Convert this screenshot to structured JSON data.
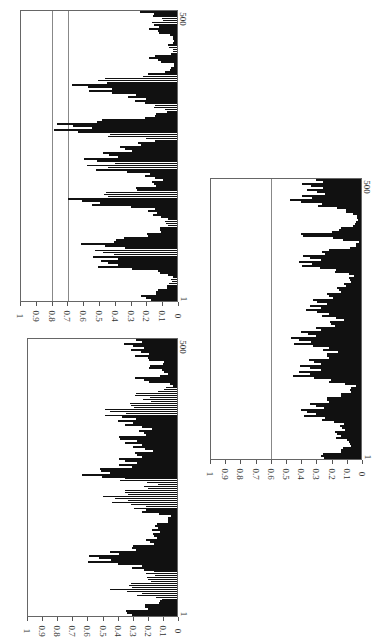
{
  "chart_data": [
    {
      "type": "bar",
      "title": "",
      "orientation": "rotated 90deg clockwise (value axis along bottom, index axis along right)",
      "xlabel": "",
      "ylabel": "",
      "x_ticks": [
        "1",
        "500"
      ],
      "y_ticks": [
        "0",
        "0.1",
        "0.2",
        "0.3",
        "0.4",
        "0.5",
        "0.6",
        "0.7",
        "0.8",
        "0.9",
        "1"
      ],
      "xlim": [
        1,
        500
      ],
      "ylim": [
        0,
        1
      ],
      "reference_lines": [
        0.8,
        0.7
      ],
      "x": [
        1,
        10,
        20,
        30,
        40,
        50,
        60,
        70,
        80,
        90,
        100,
        110,
        120,
        130,
        140,
        150,
        160,
        170,
        180,
        190,
        200,
        210,
        220,
        230,
        240,
        250,
        260,
        270,
        280,
        290,
        300,
        310,
        320,
        330,
        340,
        350,
        360,
        370,
        380,
        390,
        400,
        410,
        420,
        430,
        440,
        450,
        460,
        470,
        480,
        490,
        500
      ],
      "values": [
        0.3,
        0.25,
        0.12,
        0.05,
        0.04,
        0.15,
        0.63,
        0.5,
        0.73,
        0.55,
        0.7,
        0.3,
        0.18,
        0.1,
        0.08,
        0.18,
        0.26,
        0.85,
        0.72,
        0.4,
        0.22,
        0.15,
        0.27,
        0.65,
        0.74,
        0.62,
        0.45,
        0.35,
        0.22,
        0.84,
        0.87,
        0.76,
        0.2,
        0.08,
        0.25,
        0.3,
        0.58,
        0.76,
        0.7,
        0.27,
        0.05,
        0.02,
        0.25,
        0.02,
        0.08,
        0.02,
        0.05,
        0.22,
        0.2,
        0.12,
        0.3
      ]
    },
    {
      "type": "bar",
      "title": "",
      "orientation": "rotated 90deg clockwise (value axis along bottom, index axis along right)",
      "xlabel": "",
      "ylabel": "",
      "x_ticks": [
        "1",
        "500"
      ],
      "y_ticks": [
        "0",
        "0.1",
        "0.2",
        "0.3",
        "0.4",
        "0.5",
        "0.6",
        "0.7",
        "0.8",
        "0.9",
        "1"
      ],
      "xlim": [
        1,
        500
      ],
      "ylim": [
        0,
        1
      ],
      "reference_lines": [],
      "x": [
        1,
        10,
        20,
        30,
        40,
        50,
        60,
        70,
        80,
        90,
        100,
        110,
        120,
        130,
        140,
        150,
        160,
        170,
        180,
        190,
        200,
        210,
        220,
        230,
        240,
        250,
        260,
        270,
        280,
        290,
        300,
        310,
        320,
        330,
        340,
        350,
        360,
        370,
        380,
        390,
        400,
        410,
        420,
        430,
        440,
        450,
        460,
        470,
        480,
        490,
        500
      ],
      "values": [
        0.55,
        0.35,
        0.22,
        0.1,
        0.42,
        0.54,
        0.3,
        0.2,
        0.28,
        0.37,
        0.72,
        0.6,
        0.5,
        0.26,
        0.22,
        0.16,
        0.24,
        0.1,
        0.05,
        0.3,
        0.4,
        0.57,
        0.52,
        0.3,
        0.22,
        0.65,
        0.72,
        0.45,
        0.5,
        0.38,
        0.24,
        0.35,
        0.55,
        0.3,
        0.26,
        0.45,
        0.52,
        0.61,
        0.42,
        0.24,
        0.4,
        0.12,
        0.02,
        0.4,
        0.05,
        0.25,
        0.1,
        0.34,
        0.34,
        0.4,
        0.35
      ]
    },
    {
      "type": "bar",
      "title": "",
      "orientation": "rotated 90deg clockwise (value axis along bottom, index axis along right)",
      "xlabel": "",
      "ylabel": "",
      "x_ticks": [
        "1",
        "500"
      ],
      "y_ticks": [
        "0",
        "0.1",
        "0.2",
        "0.3",
        "0.4",
        "0.5",
        "0.6",
        "0.7",
        "0.8",
        "0.9",
        "1"
      ],
      "xlim": [
        1,
        500
      ],
      "ylim": [
        0,
        1
      ],
      "reference_lines": [
        0.6
      ],
      "x": [
        1,
        10,
        20,
        30,
        40,
        50,
        60,
        70,
        80,
        90,
        100,
        110,
        120,
        130,
        140,
        150,
        160,
        170,
        180,
        190,
        200,
        210,
        220,
        230,
        240,
        250,
        260,
        270,
        280,
        290,
        300,
        310,
        320,
        330,
        340,
        350,
        360,
        370,
        380,
        390,
        400,
        410,
        420,
        430,
        440,
        450,
        460,
        470,
        480,
        490,
        500
      ],
      "values": [
        0.45,
        0.25,
        0.12,
        0.08,
        0.25,
        0.18,
        0.15,
        0.28,
        0.55,
        0.42,
        0.36,
        0.22,
        0.12,
        0.05,
        0.3,
        0.51,
        0.48,
        0.45,
        0.35,
        0.2,
        0.42,
        0.58,
        0.47,
        0.4,
        0.3,
        0.18,
        0.35,
        0.4,
        0.42,
        0.3,
        0.2,
        0.15,
        0.1,
        0.08,
        0.3,
        0.5,
        0.48,
        0.37,
        0.05,
        0.02,
        0.57,
        0.2,
        0.05,
        0.02,
        0.08,
        0.22,
        0.5,
        0.48,
        0.4,
        0.45,
        0.38
      ]
    }
  ]
}
